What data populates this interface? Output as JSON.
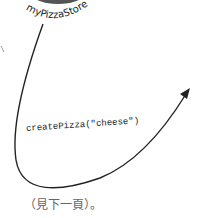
{
  "diagram": {
    "store_object": {
      "label": "myPizzaStore"
    },
    "call_arrow": {
      "label": "createPizza(\"cheese\")"
    },
    "footnote": {
      "text": "（見下一頁）。"
    },
    "colors": {
      "stroke": "#222222",
      "circle_fill": "#555555",
      "footnote_text": "#666666"
    }
  }
}
